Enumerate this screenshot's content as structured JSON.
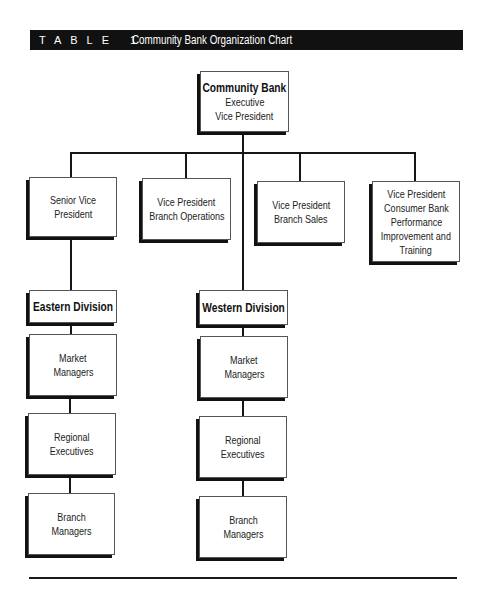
{
  "header": {
    "label": "TABLE 1",
    "title": "Community Bank Organization Chart",
    "bar_color": "#111111"
  },
  "chart": {
    "root": {
      "title": "Community Bank",
      "lines": [
        "Executive",
        "Vice President"
      ]
    },
    "level2": [
      {
        "lines": [
          "Senior Vice",
          "President"
        ]
      },
      {
        "lines": [
          "Vice President",
          "Branch Operations"
        ]
      },
      {
        "lines": [
          "Vice President",
          "Branch Sales"
        ]
      },
      {
        "lines": [
          "Vice President",
          "Consumer Bank",
          "Performance",
          "Improvement and",
          "Training"
        ]
      }
    ],
    "divisions": [
      {
        "title": "Eastern Division",
        "children": [
          {
            "lines": [
              "Market",
              "Managers"
            ]
          },
          {
            "lines": [
              "Regional",
              "Executives"
            ]
          },
          {
            "lines": [
              "Branch",
              "Managers"
            ]
          }
        ]
      },
      {
        "title": "Western Division",
        "children": [
          {
            "lines": [
              "Market",
              "Managers"
            ]
          },
          {
            "lines": [
              "Regional",
              "Executives"
            ]
          },
          {
            "lines": [
              "Branch",
              "Managers"
            ]
          }
        ]
      }
    ]
  }
}
